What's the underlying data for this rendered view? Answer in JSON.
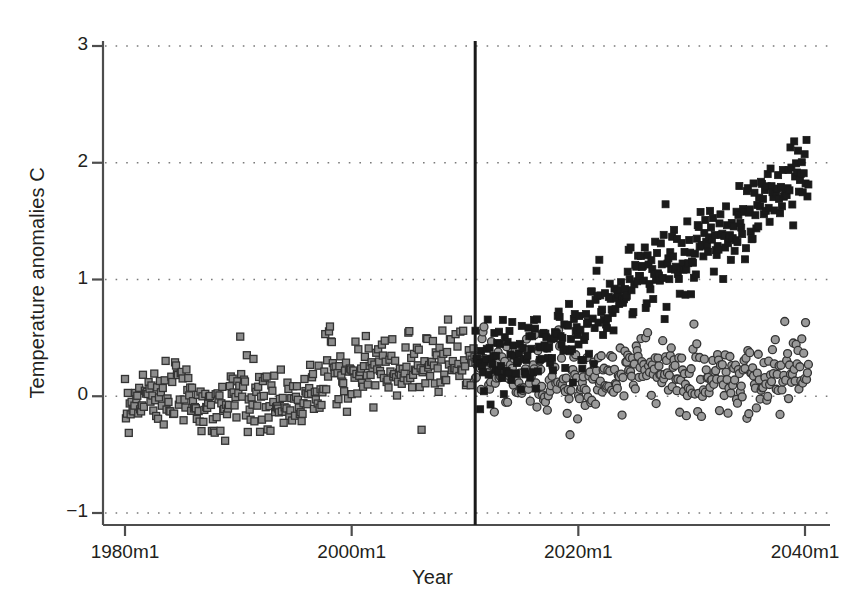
{
  "chart_data": {
    "type": "scatter",
    "title": "",
    "xlabel": "Year",
    "ylabel": "Temperature anomalies C",
    "xlim": [
      1980,
      2040.5
    ],
    "ylim": [
      -1,
      3
    ],
    "grid": true,
    "grid_style": "dotted-horizontal",
    "legend": "none",
    "yticks": [
      3,
      2,
      1,
      0,
      -1
    ],
    "ytick_labels": [
      "3",
      "2",
      "1",
      "0",
      "-1"
    ],
    "xticks": [
      1980,
      2000,
      2020,
      2040
    ],
    "xtick_labels": [
      "1980m1",
      "2000m1",
      "2020m1",
      "2040m1"
    ],
    "annotations": [
      {
        "type": "vline",
        "x": 2010.9,
        "label": "forecast-start-line",
        "color": "#1a1a1a"
      }
    ],
    "series": [
      {
        "name": "historical",
        "marker": "square",
        "color": "#8c8c8c",
        "edge_color": "#333333",
        "x_start": 1980.0,
        "x_end": 2010.92,
        "n_points": 372,
        "frequency": "monthly",
        "trend_start": -0.12,
        "trend_end": 0.3,
        "noise_sd": 0.14,
        "y_min": -0.45,
        "y_max": 0.66,
        "notes": "observed monthly global temperature anomalies, slow warming trend with month-to-month noise and a 1998 El Nino spike"
      },
      {
        "name": "forecast-high",
        "marker": "square",
        "color": "#1a1a1a",
        "edge_color": "#1a1a1a",
        "x_start": 2010.92,
        "x_end": 2040.3,
        "n_points": 353,
        "frequency": "monthly",
        "trend_start": 0.18,
        "trend_end": 1.9,
        "noise_sd": 0.16,
        "y_min": -0.35,
        "y_max": 2.3,
        "notes": "projected scenario with strong warming trend, reaching about 2 C by 2040"
      },
      {
        "name": "forecast-low",
        "marker": "circle",
        "color": "#9a9a9a",
        "edge_color": "#333333",
        "x_start": 2010.92,
        "x_end": 2040.3,
        "n_points": 353,
        "frequency": "monthly",
        "trend_start": 0.2,
        "trend_end": 0.16,
        "noise_sd": 0.15,
        "y_min": -0.33,
        "y_max": 0.72,
        "notes": "projected scenario with flat trend, anomalies staying near present levels through 2040"
      }
    ]
  },
  "axes": {
    "y_title": "Temperature anomalies C",
    "x_title": "Year"
  },
  "colors": {
    "background": "#ffffff",
    "axis": "#4d4d4d",
    "gridline": "#7a7a7a",
    "historical_marker": "#8c8c8c",
    "forecast_high_marker": "#1a1a1a",
    "forecast_low_marker": "#9a9a9a",
    "vline": "#1a1a1a"
  }
}
